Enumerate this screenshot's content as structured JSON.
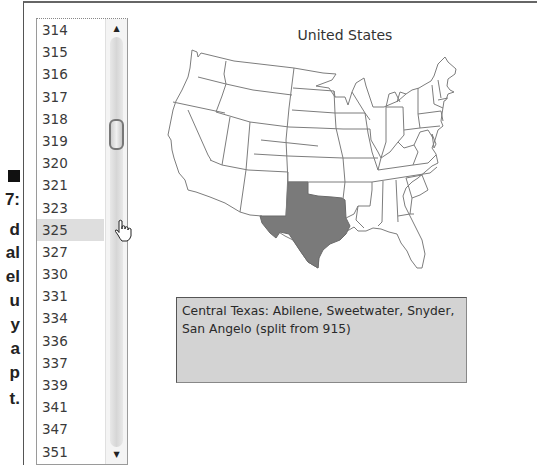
{
  "caption_fragments": [
    "7:",
    "d",
    "al",
    "el",
    "u",
    "y",
    "a",
    "p",
    "t."
  ],
  "area_code_list": {
    "items": [
      "314",
      "315",
      "316",
      "317",
      "318",
      "319",
      "320",
      "321",
      "323",
      "325",
      "327",
      "330",
      "331",
      "334",
      "336",
      "337",
      "339",
      "341",
      "347",
      "351"
    ],
    "selected": "325",
    "selected_index": 9
  },
  "scrollbar": {
    "up_arrow": "▲",
    "down_arrow": "▼"
  },
  "map": {
    "title": "United States",
    "highlighted_state": "Texas",
    "highlight_color": "#7a7a7a",
    "outline_color": "#7d7d7d"
  },
  "info_box": {
    "text": "Central Texas: Abilene, Sweetwater, Snyder, San Angelo (split from 915)"
  }
}
